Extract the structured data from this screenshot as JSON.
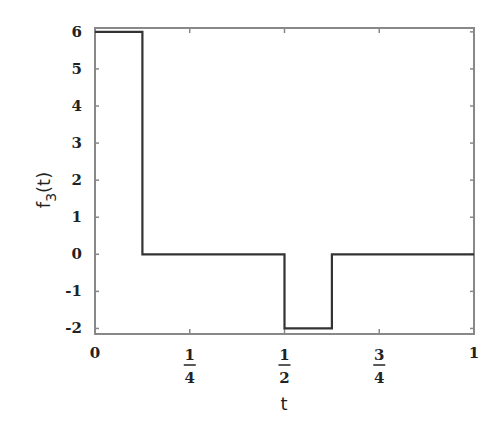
{
  "chart_data": {
    "type": "line",
    "title": "",
    "xlabel": "t",
    "ylabel": "f3(t)",
    "ylabel_main": "f",
    "ylabel_sub": "3",
    "ylabel_arg": "(t)",
    "xlim": [
      0,
      1
    ],
    "ylim": [
      -2,
      6
    ],
    "grid": false,
    "legend": null,
    "x_ticks": [
      {
        "value": 0,
        "label": "0"
      },
      {
        "value": 0.25,
        "num": "1",
        "den": "4"
      },
      {
        "value": 0.5,
        "num": "1",
        "den": "2"
      },
      {
        "value": 0.75,
        "num": "3",
        "den": "4"
      },
      {
        "value": 1,
        "label": "1"
      }
    ],
    "y_ticks": [
      6,
      5,
      4,
      3,
      2,
      1,
      0,
      -1,
      -2
    ],
    "series": [
      {
        "name": "f3(t)",
        "step": true,
        "x": [
          0,
          0.125,
          0.125,
          0.5,
          0.5,
          0.625,
          0.625,
          1
        ],
        "y": [
          6,
          6,
          0,
          0,
          -2,
          -2,
          0,
          0
        ]
      }
    ],
    "line_color": "#333333",
    "frame_color": "#888888"
  }
}
